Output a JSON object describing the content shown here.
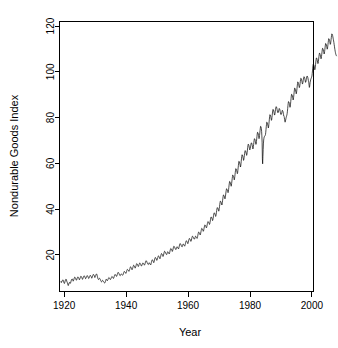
{
  "figure": {
    "background_color": "#ffffff",
    "foreground_color": "#000000"
  },
  "chart_data": {
    "type": "line",
    "title": "",
    "subtitle": "",
    "xlabel": "Year",
    "ylabel": "Nondurable Goods Index",
    "xlim": [
      1918.5,
      2000.5
    ],
    "ylim": [
      4,
      122
    ],
    "xticks": [
      1920,
      1940,
      1960,
      1980,
      2000
    ],
    "xticklabels": [
      "1920",
      "1940",
      "1960",
      "1980",
      "2000"
    ],
    "yticks": [
      20,
      40,
      60,
      80,
      100,
      120
    ],
    "yticklabels": [
      "20",
      "40",
      "60",
      "80",
      "100",
      "120"
    ],
    "grid": false,
    "legend": null,
    "legend_position": "none",
    "annotations": [],
    "series": [
      {
        "name": "Nondurable Goods Index",
        "color": "#000000",
        "line_width": 0.7,
        "frequency": "monthly",
        "x_start": 1919.0,
        "x_end": 2000.0,
        "x_step": 0.0833333,
        "values": [
          8.4,
          7.9,
          8.1,
          8.3,
          8.6,
          8.8,
          8.9,
          9.1,
          9.0,
          8.7,
          8.3,
          7.9,
          7.7,
          7.5,
          7.8,
          8.2,
          8.6,
          9.0,
          9.2,
          9.4,
          9.3,
          9.0,
          8.6,
          8.2,
          8.0,
          7.6,
          7.2,
          6.8,
          6.6,
          6.9,
          7.3,
          7.7,
          7.9,
          8.0,
          7.8,
          7.5,
          7.6,
          7.8,
          8.2,
          8.6,
          9.0,
          9.3,
          9.4,
          9.5,
          9.4,
          9.1,
          8.8,
          8.5,
          8.7,
          9.0,
          9.4,
          9.8,
          10.1,
          10.3,
          10.2,
          10.1,
          9.9,
          9.6,
          9.2,
          8.9,
          9.0,
          9.2,
          9.6,
          9.9,
          10.2,
          10.4,
          10.3,
          10.2,
          10.0,
          9.7,
          9.4,
          9.1,
          9.3,
          9.6,
          9.9,
          10.2,
          10.5,
          10.7,
          10.6,
          10.4,
          10.2,
          9.9,
          9.6,
          9.3,
          9.5,
          9.8,
          10.1,
          10.4,
          10.7,
          10.9,
          10.8,
          10.7,
          10.5,
          10.2,
          9.9,
          9.6,
          9.7,
          9.9,
          10.2,
          10.5,
          10.8,
          11.0,
          10.9,
          10.8,
          10.6,
          10.3,
          10.0,
          9.7,
          9.8,
          10.0,
          10.3,
          10.6,
          10.9,
          11.1,
          11.0,
          10.9,
          10.7,
          10.4,
          10.1,
          9.8,
          10.0,
          10.3,
          10.6,
          11.0,
          11.3,
          11.5,
          11.4,
          11.3,
          11.1,
          10.8,
          10.4,
          10.1,
          10.3,
          10.6,
          10.9,
          11.2,
          11.5,
          11.7,
          11.6,
          11.4,
          11.0,
          10.5,
          10.0,
          9.6,
          9.4,
          9.2,
          9.3,
          9.5,
          9.7,
          9.8,
          9.7,
          9.5,
          9.3,
          9.0,
          8.7,
          8.4,
          8.3,
          8.2,
          8.3,
          8.5,
          8.7,
          8.9,
          8.8,
          8.7,
          8.5,
          8.3,
          8.1,
          7.9,
          7.8,
          7.7,
          7.8,
          8.0,
          8.4,
          8.8,
          9.2,
          9.4,
          9.3,
          9.1,
          8.9,
          8.7,
          8.8,
          9.0,
          9.3,
          9.6,
          9.9,
          10.1,
          10.0,
          9.9,
          9.8,
          9.6,
          9.4,
          9.2,
          9.3,
          9.5,
          9.8,
          10.1,
          10.4,
          10.6,
          10.5,
          10.4,
          10.3,
          10.1,
          9.9,
          9.7,
          9.9,
          10.2,
          10.6,
          11.0,
          11.3,
          11.5,
          11.4,
          11.3,
          11.2,
          11.0,
          10.8,
          10.6,
          10.8,
          11.1,
          11.5,
          11.9,
          12.2,
          12.4,
          12.3,
          12.2,
          12.0,
          11.7,
          11.4,
          11.1,
          11.0,
          10.9,
          11.0,
          11.2,
          11.5,
          11.7,
          11.6,
          11.5,
          11.4,
          11.3,
          11.2,
          11.1,
          11.3,
          11.6,
          12.0,
          12.3,
          12.6,
          12.8,
          12.7,
          12.6,
          12.5,
          12.3,
          12.1,
          11.9,
          12.1,
          12.4,
          12.8,
          13.2,
          13.5,
          13.7,
          13.6,
          13.5,
          13.4,
          13.2,
          13.0,
          12.8,
          13.0,
          13.3,
          13.7,
          14.1,
          14.5,
          14.8,
          14.7,
          14.6,
          14.4,
          14.1,
          13.8,
          13.5,
          13.7,
          14.0,
          14.4,
          14.8,
          15.2,
          15.5,
          15.4,
          15.3,
          15.1,
          14.8,
          14.5,
          14.2,
          14.4,
          14.7,
          15.1,
          15.5,
          15.9,
          16.2,
          16.1,
          16.0,
          15.8,
          15.5,
          15.2,
          14.9,
          15.0,
          15.3,
          15.7,
          16.0,
          16.3,
          16.5,
          16.4,
          16.2,
          16.0,
          15.7,
          15.4,
          15.1,
          15.2,
          15.4,
          15.7,
          16.0,
          16.3,
          16.5,
          16.4,
          16.3,
          16.1,
          15.9,
          15.7,
          15.5,
          15.7,
          16.0,
          16.4,
          16.8,
          17.2,
          17.5,
          17.4,
          17.3,
          17.1,
          16.8,
          16.5,
          16.2,
          16.1,
          15.9,
          15.8,
          16.0,
          16.3,
          16.6,
          16.5,
          16.4,
          16.2,
          16.0,
          15.8,
          15.6,
          15.8,
          16.2,
          16.7,
          17.2,
          17.6,
          17.9,
          17.8,
          17.7,
          17.5,
          17.2,
          16.9,
          16.6,
          16.8,
          17.2,
          17.7,
          18.2,
          18.6,
          18.9,
          18.8,
          18.7,
          18.5,
          18.2,
          17.9,
          17.6,
          17.8,
          18.1,
          18.5,
          18.9,
          19.3,
          19.6,
          19.5,
          19.4,
          19.2,
          18.9,
          18.6,
          18.3,
          18.5,
          18.9,
          19.4,
          19.9,
          20.3,
          20.6,
          20.5,
          20.4,
          20.2,
          19.9,
          19.6,
          19.3,
          19.5,
          19.9,
          20.4,
          20.9,
          21.3,
          21.6,
          21.5,
          21.4,
          21.2,
          20.9,
          20.6,
          20.3,
          20.2,
          20.1,
          20.3,
          20.7,
          21.1,
          21.4,
          21.3,
          21.2,
          21.0,
          20.8,
          20.6,
          20.4,
          20.7,
          21.1,
          21.6,
          22.1,
          22.5,
          22.8,
          22.7,
          22.6,
          22.4,
          22.1,
          21.8,
          21.5,
          21.7,
          22.1,
          22.6,
          23.1,
          23.5,
          23.8,
          23.7,
          23.6,
          23.4,
          23.1,
          22.8,
          22.5,
          22.4,
          22.3,
          22.5,
          22.9,
          23.3,
          23.6,
          23.5,
          23.4,
          23.2,
          23.0,
          22.8,
          22.6,
          22.9,
          23.3,
          23.8,
          24.3,
          24.7,
          25.0,
          24.9,
          24.8,
          24.6,
          24.3,
          24.0,
          23.7,
          23.6,
          23.5,
          23.7,
          24.1,
          24.5,
          24.8,
          24.7,
          24.6,
          24.4,
          24.2,
          24.0,
          23.8,
          24.1,
          24.5,
          25.0,
          25.5,
          25.9,
          26.2,
          26.1,
          26.0,
          25.8,
          25.5,
          25.2,
          24.9,
          25.1,
          25.5,
          26.0,
          26.5,
          26.9,
          27.2,
          27.1,
          27.0,
          26.8,
          26.5,
          26.2,
          25.9,
          26.1,
          26.5,
          27.0,
          27.5,
          27.9,
          28.2,
          28.1,
          28.0,
          27.8,
          27.5,
          27.2,
          26.9,
          27.0,
          26.9,
          27.1,
          27.5,
          27.9,
          28.2,
          28.1,
          28.0,
          27.8,
          27.6,
          27.4,
          27.2,
          27.5,
          28.0,
          28.6,
          29.2,
          29.7,
          30.0,
          29.9,
          29.8,
          29.6,
          29.3,
          29.0,
          28.7,
          29.0,
          29.5,
          30.1,
          30.7,
          31.2,
          31.6,
          31.5,
          31.4,
          31.2,
          30.9,
          30.6,
          30.3,
          30.5,
          31.0,
          31.6,
          32.2,
          32.7,
          33.1,
          33.0,
          32.9,
          32.7,
          32.4,
          32.1,
          31.8,
          32.0,
          32.5,
          33.1,
          33.7,
          34.2,
          34.6,
          34.5,
          34.4,
          34.2,
          33.9,
          33.6,
          33.3,
          33.5,
          34.1,
          34.8,
          35.5,
          36.1,
          36.6,
          36.5,
          36.4,
          36.2,
          35.8,
          35.4,
          35.0,
          35.3,
          35.9,
          36.6,
          37.3,
          37.9,
          38.4,
          38.3,
          38.2,
          38.0,
          37.6,
          37.2,
          36.8,
          37.1,
          37.8,
          38.6,
          39.4,
          40.1,
          40.7,
          40.6,
          40.5,
          40.3,
          39.9,
          39.5,
          39.1,
          39.5,
          40.3,
          41.2,
          42.1,
          42.9,
          43.5,
          43.4,
          43.3,
          43.0,
          42.6,
          42.2,
          41.8,
          42.2,
          43.0,
          43.9,
          44.8,
          45.6,
          46.2,
          46.1,
          46.0,
          45.7,
          45.3,
          44.9,
          44.5,
          44.9,
          45.7,
          46.6,
          47.5,
          48.3,
          48.9,
          48.8,
          48.7,
          48.4,
          48.0,
          47.6,
          47.2,
          47.6,
          48.5,
          49.5,
          50.5,
          51.4,
          52.1,
          52.0,
          51.8,
          51.5,
          51.0,
          50.5,
          50.0,
          50.4,
          51.3,
          52.3,
          53.3,
          54.2,
          54.9,
          54.8,
          54.6,
          54.3,
          53.8,
          53.3,
          52.8,
          53.2,
          54.1,
          55.1,
          56.1,
          57.0,
          57.7,
          57.6,
          57.4,
          57.0,
          56.5,
          56.0,
          55.5,
          55.9,
          56.9,
          58.0,
          59.1,
          60.1,
          60.9,
          60.8,
          60.6,
          60.2,
          59.6,
          59.0,
          58.4,
          58.8,
          59.8,
          60.9,
          62.0,
          63.0,
          63.8,
          63.7,
          63.5,
          63.1,
          62.5,
          61.9,
          61.3,
          61.6,
          62.4,
          63.3,
          64.2,
          65.0,
          65.6,
          65.5,
          65.3,
          65.0,
          64.5,
          64.0,
          63.5,
          63.9,
          64.8,
          65.8,
          66.8,
          67.7,
          68.4,
          68.3,
          68.1,
          67.7,
          67.1,
          66.5,
          65.9,
          66.1,
          66.6,
          67.2,
          67.9,
          68.5,
          69.0,
          68.9,
          68.7,
          68.3,
          67.7,
          67.0,
          66.3,
          66.5,
          67.3,
          68.2,
          69.2,
          70.1,
          70.8,
          70.7,
          70.5,
          70.1,
          69.5,
          68.9,
          68.3,
          68.6,
          69.6,
          70.7,
          71.8,
          72.8,
          73.6,
          73.5,
          73.3,
          72.9,
          72.2,
          71.5,
          70.8,
          71.2,
          72.2,
          73.3,
          74.4,
          75.4,
          76.2,
          76.1,
          75.8,
          75.2,
          74.0,
          72.0,
          69.0,
          62.0,
          59.8,
          63.0,
          66.0,
          68.5,
          70.2,
          71.0,
          71.5,
          71.8,
          71.9,
          72.0,
          72.2,
          72.6,
          73.6,
          74.8,
          76.0,
          77.1,
          78.0,
          77.9,
          77.7,
          77.3,
          76.7,
          76.1,
          75.5,
          75.9,
          76.9,
          78.1,
          79.3,
          80.4,
          81.3,
          81.2,
          81.0,
          80.6,
          80.0,
          79.4,
          78.8,
          79.1,
          80.0,
          81.0,
          82.0,
          82.9,
          83.6,
          83.5,
          83.3,
          82.9,
          82.3,
          81.7,
          81.1,
          81.3,
          82.0,
          82.8,
          83.6,
          84.3,
          84.8,
          84.7,
          84.5,
          84.1,
          83.5,
          82.9,
          82.3,
          82.4,
          82.2,
          82.4,
          82.9,
          83.5,
          84.0,
          83.9,
          83.7,
          83.3,
          82.7,
          82.1,
          81.5,
          81.6,
          81.4,
          81.6,
          82.1,
          82.7,
          83.2,
          83.1,
          82.9,
          82.5,
          81.9,
          81.3,
          80.7,
          80.6,
          80.0,
          79.2,
          78.4,
          78.0,
          78.3,
          78.9,
          79.5,
          80.0,
          80.4,
          80.8,
          81.2,
          81.8,
          82.8,
          84.0,
          85.2,
          86.2,
          87.0,
          86.9,
          86.7,
          86.3,
          85.7,
          85.1,
          84.5,
          84.9,
          85.9,
          87.1,
          88.3,
          89.4,
          90.2,
          90.1,
          89.9,
          89.5,
          88.9,
          88.3,
          87.7,
          88.0,
          88.9,
          90.0,
          91.1,
          92.1,
          92.9,
          92.8,
          92.6,
          92.2,
          91.6,
          91.0,
          90.4,
          90.7,
          91.6,
          92.7,
          93.8,
          94.8,
          95.6,
          95.5,
          95.3,
          94.9,
          94.3,
          93.7,
          93.1,
          93.3,
          94.0,
          94.9,
          95.8,
          96.6,
          97.2,
          97.1,
          96.9,
          96.5,
          95.9,
          95.3,
          94.7,
          94.8,
          95.4,
          96.1,
          96.8,
          97.4,
          97.9,
          97.8,
          97.6,
          97.2,
          96.6,
          96.0,
          95.4,
          95.5,
          96.0,
          96.6,
          97.2,
          97.8,
          98.2,
          98.1,
          97.9,
          97.5,
          96.9,
          96.3,
          95.7,
          95.2,
          94.0,
          93.2,
          93.6,
          94.5,
          95.4,
          96.0,
          96.5,
          96.9,
          97.2,
          97.5,
          97.8,
          98.2,
          99.2,
          100.4,
          101.6,
          102.6,
          103.4,
          103.3,
          103.1,
          102.7,
          102.1,
          101.5,
          100.9,
          101.2,
          102.1,
          103.2,
          104.3,
          105.3,
          106.1,
          106.0,
          105.8,
          105.4,
          104.8,
          104.2,
          103.6,
          103.8,
          104.6,
          105.6,
          106.6,
          107.5,
          108.2,
          108.1,
          107.9,
          107.5,
          106.9,
          106.3,
          105.7,
          105.9,
          106.7,
          107.7,
          108.7,
          109.6,
          110.3,
          110.2,
          110.0,
          109.6,
          109.0,
          108.4,
          107.8,
          108.0,
          108.8,
          109.8,
          110.8,
          111.7,
          112.4,
          112.3,
          112.1,
          111.7,
          111.1,
          110.5,
          109.9,
          110.1,
          110.9,
          111.9,
          112.9,
          113.8,
          114.5,
          114.4,
          114.2,
          113.8,
          113.2,
          112.6,
          112.0,
          112.2,
          113.0,
          114.0,
          115.0,
          115.9,
          116.6,
          116.5,
          116.3,
          115.9,
          115.3,
          114.7,
          114.1,
          113.5,
          112.8,
          112.0,
          111.2,
          110.4,
          109.7,
          109.0,
          108.4,
          107.9,
          107.5,
          107.2,
          107.0
        ]
      }
    ]
  }
}
